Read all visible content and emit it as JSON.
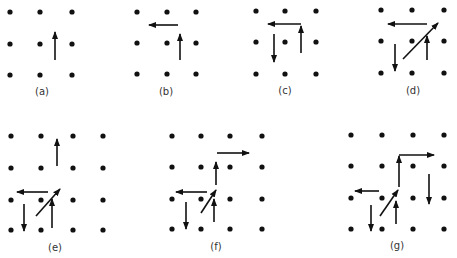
{
  "colors": {
    "ink": "#111111",
    "label": "#333333",
    "background": "#ffffff"
  },
  "panels": [
    {
      "id": "a",
      "label": "(a)",
      "dots": {
        "xs": [
          10,
          40,
          72
        ],
        "ys": [
          12,
          44,
          75
        ]
      },
      "arrows": [
        {
          "x1": 55,
          "y1": 60,
          "x2": 55,
          "y2": 32
        }
      ],
      "label_pos": [
        42,
        95
      ]
    },
    {
      "id": "b",
      "label": "(b)",
      "dots": {
        "xs": [
          137,
          167,
          196
        ],
        "ys": [
          12,
          43,
          74
        ]
      },
      "arrows": [
        {
          "x1": 180,
          "y1": 60,
          "x2": 180,
          "y2": 34
        },
        {
          "x1": 178,
          "y1": 25,
          "x2": 149,
          "y2": 25
        }
      ],
      "label_pos": [
        166,
        95
      ]
    },
    {
      "id": "c",
      "label": "(c)",
      "dots": {
        "xs": [
          256,
          285,
          316
        ],
        "ys": [
          11,
          42,
          74
        ]
      },
      "arrows": [
        {
          "x1": 301,
          "y1": 53,
          "x2": 301,
          "y2": 26
        },
        {
          "x1": 301,
          "y1": 24,
          "x2": 268,
          "y2": 24
        },
        {
          "x1": 274,
          "y1": 34,
          "x2": 274,
          "y2": 62
        }
      ],
      "label_pos": [
        285,
        94
      ]
    },
    {
      "id": "d",
      "label": "(d)",
      "dots": {
        "xs": [
          381,
          412,
          444
        ],
        "ys": [
          10,
          41,
          73
        ]
      },
      "arrows": [
        {
          "x1": 427,
          "y1": 60,
          "x2": 427,
          "y2": 36
        },
        {
          "x1": 427,
          "y1": 24,
          "x2": 388,
          "y2": 24
        },
        {
          "x1": 395,
          "y1": 44,
          "x2": 395,
          "y2": 71
        },
        {
          "x1": 403,
          "y1": 59,
          "x2": 438,
          "y2": 23
        }
      ],
      "label_pos": [
        413,
        94
      ]
    },
    {
      "id": "e",
      "label": "(e)",
      "dots": {
        "xs": [
          11,
          41,
          73,
          103
        ],
        "ys": [
          136,
          168,
          200,
          230
        ]
      },
      "arrows": [
        {
          "x1": 57,
          "y1": 166,
          "x2": 57,
          "y2": 139
        },
        {
          "x1": 48,
          "y1": 192,
          "x2": 17,
          "y2": 192
        },
        {
          "x1": 24,
          "y1": 204,
          "x2": 24,
          "y2": 231
        },
        {
          "x1": 36,
          "y1": 216,
          "x2": 60,
          "y2": 189
        },
        {
          "x1": 52,
          "y1": 228,
          "x2": 52,
          "y2": 199
        }
      ],
      "label_pos": [
        55,
        251
      ]
    },
    {
      "id": "f",
      "label": "(f)",
      "dots": {
        "xs": [
          172,
          201,
          230,
          262
        ],
        "ys": [
          136,
          167,
          199,
          229
        ]
      },
      "arrows": [
        {
          "x1": 217,
          "y1": 153,
          "x2": 249,
          "y2": 153
        },
        {
          "x1": 216,
          "y1": 185,
          "x2": 216,
          "y2": 162
        },
        {
          "x1": 207,
          "y1": 192,
          "x2": 176,
          "y2": 192
        },
        {
          "x1": 186,
          "y1": 202,
          "x2": 186,
          "y2": 229
        },
        {
          "x1": 201,
          "y1": 213,
          "x2": 216,
          "y2": 190
        },
        {
          "x1": 214,
          "y1": 222,
          "x2": 214,
          "y2": 199
        }
      ],
      "label_pos": [
        216,
        250
      ]
    },
    {
      "id": "g",
      "label": "(g)",
      "dots": {
        "xs": [
          351,
          382,
          413,
          444
        ],
        "ys": [
          135,
          166,
          198,
          229
        ]
      },
      "arrows": [
        {
          "x1": 399,
          "y1": 155,
          "x2": 434,
          "y2": 155
        },
        {
          "x1": 399,
          "y1": 187,
          "x2": 399,
          "y2": 156
        },
        {
          "x1": 429,
          "y1": 174,
          "x2": 429,
          "y2": 204
        },
        {
          "x1": 379,
          "y1": 191,
          "x2": 355,
          "y2": 191
        },
        {
          "x1": 371,
          "y1": 205,
          "x2": 371,
          "y2": 231
        },
        {
          "x1": 380,
          "y1": 216,
          "x2": 398,
          "y2": 190
        },
        {
          "x1": 396,
          "y1": 224,
          "x2": 396,
          "y2": 201
        }
      ],
      "label_pos": [
        397,
        249
      ]
    }
  ]
}
